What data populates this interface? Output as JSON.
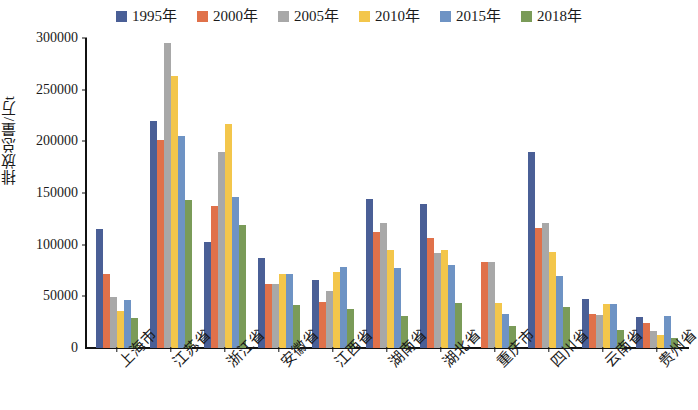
{
  "chart_data": {
    "type": "bar",
    "title": "",
    "subtitle": "",
    "xlabel": "",
    "ylabel": "排放总量/万t",
    "ylim": [
      0,
      300000
    ],
    "ytick_values": [
      300000,
      250000,
      200000,
      150000,
      100000,
      50000,
      0
    ],
    "ytick_labels": [
      "300000",
      "250000",
      "200000",
      "150000",
      "100000",
      "50000",
      "0"
    ],
    "grid": false,
    "legend_position": "top-center",
    "categories": [
      "上海市",
      "江苏省",
      "浙江省",
      "安徽省",
      "江西省",
      "湖南省",
      "湖北省",
      "重庆市",
      "四川省",
      "云南省",
      "贵州省"
    ],
    "series": [
      {
        "name": "1995年",
        "color": "#4a5f96",
        "values": [
          115000,
          220000,
          103000,
          87000,
          66000,
          144000,
          139000,
          0,
          190000,
          47000,
          30000
        ]
      },
      {
        "name": "2000年",
        "color": "#e0714a",
        "values": [
          72000,
          201000,
          137000,
          62000,
          45000,
          112000,
          106000,
          83000,
          116000,
          33000,
          24000
        ]
      },
      {
        "name": "2005年",
        "color": "#a8a8a8",
        "values": [
          49000,
          295000,
          190000,
          62000,
          55000,
          121000,
          92000,
          83000,
          121000,
          32000,
          16000
        ]
      },
      {
        "name": "2010年",
        "color": "#f3c64b",
        "values": [
          36000,
          263000,
          217000,
          72000,
          74000,
          95000,
          95000,
          44000,
          93000,
          43000,
          13000
        ]
      },
      {
        "name": "2015年",
        "color": "#6e93c4",
        "values": [
          46000,
          205000,
          146000,
          72000,
          78000,
          77000,
          80000,
          33000,
          70000,
          43000,
          31000
        ]
      },
      {
        "name": "2018年",
        "color": "#7a9b58",
        "values": [
          29000,
          143000,
          119000,
          42000,
          38000,
          31000,
          44000,
          21000,
          40000,
          17000,
          10000
        ]
      }
    ]
  }
}
